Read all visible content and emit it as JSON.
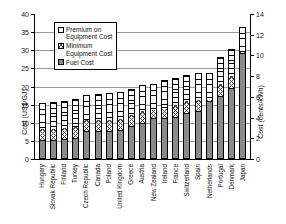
{
  "chart_data": {
    "type": "bar",
    "subtype": "stacked-vertical",
    "title": "",
    "xlabel": "",
    "ylabel": "Cost (US$/GJ)",
    "ylabel_secondary": "Cost (cents/kWh)",
    "ylim": [
      0,
      40
    ],
    "ylim_secondary": [
      0,
      14
    ],
    "yticks": [
      0,
      5,
      10,
      15,
      20,
      25,
      30,
      35,
      40
    ],
    "yticks_secondary": [
      0,
      2,
      4,
      6,
      8,
      10,
      12,
      14
    ],
    "grid": true,
    "grid_axis": "y",
    "legend_position": "upper-left-inside",
    "categories": [
      "Hungary",
      "Slovak Republic",
      "Finland",
      "Turkey",
      "Czech Republic",
      "Canada",
      "Poland",
      "United Kingdom",
      "Greece",
      "Austria",
      "New Zealand",
      "Ireland",
      "France",
      "Switzerland",
      "Spain",
      "Netherlands",
      "Portugal",
      "Denmark",
      "Japan"
    ],
    "series": [
      {
        "name": "Fuel Cost",
        "pattern": "solid-gray",
        "color": "#8a8a8a",
        "values": [
          4.9,
          4.9,
          5.2,
          5.6,
          7.3,
          7.3,
          7.3,
          7.6,
          8.7,
          9.7,
          11.0,
          11.1,
          11.3,
          12.3,
          12.9,
          15.7,
          17.1,
          19.3,
          28.7
        ]
      },
      {
        "name": "Minimum Equipment Cost",
        "pattern": "crosshatch",
        "color": "#ffffff",
        "values": [
          3.0,
          3.0,
          3.0,
          3.0,
          3.2,
          3.2,
          3.2,
          3.2,
          3.2,
          3.1,
          2.2,
          2.2,
          3.3,
          3.2,
          3.1,
          0.3,
          3.3,
          3.2,
          0.3
        ]
      },
      {
        "name": "Premium on Equipment Cost",
        "pattern": "horizontal-lines",
        "color": "#ffffff",
        "values": [
          6.9,
          7.1,
          7.2,
          7.2,
          6.6,
          6.8,
          7.0,
          7.0,
          6.7,
          6.9,
          6.8,
          7.7,
          7.0,
          7.0,
          7.0,
          7.1,
          7.0,
          7.1,
          6.5
        ]
      }
    ],
    "totals": [
      14.8,
      15.0,
      15.4,
      15.8,
      17.1,
      17.3,
      17.5,
      17.8,
      18.6,
      19.7,
      20.0,
      21.0,
      21.6,
      22.5,
      23.0,
      23.1,
      27.4,
      29.6,
      35.5
    ]
  },
  "legend": {
    "items": [
      {
        "label": "Premium on\nEquipment Cost",
        "key": "premium"
      },
      {
        "label": "Minimum\nEquipment Cost",
        "key": "minimum"
      },
      {
        "label": "Fuel Cost",
        "key": "fuel"
      }
    ]
  }
}
